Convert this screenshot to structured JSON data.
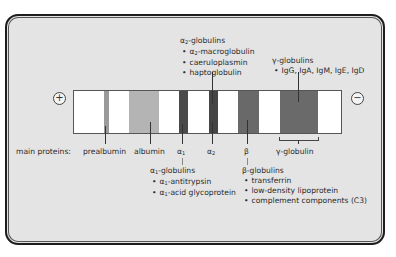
{
  "diagram": {
    "anode_symbol": "+",
    "cathode_symbol": "−",
    "row_label": "main proteins:",
    "bands": [
      {
        "id": "prealbumin",
        "label": "prealbumin",
        "color": "#9a9a9a"
      },
      {
        "id": "albumin",
        "label": "albumin",
        "color": "#b4b4b4"
      },
      {
        "id": "alpha1",
        "label": "α1",
        "color": "#4a4a4a"
      },
      {
        "id": "alpha2",
        "label": "α2",
        "color": "#454545"
      },
      {
        "id": "beta",
        "label": "β",
        "color": "#696969"
      },
      {
        "id": "gamma",
        "label": "γ-globulin",
        "color": "#6a6a6a"
      }
    ],
    "groups": {
      "alpha2": {
        "title": "α2-globulins",
        "items": [
          "α2-macroglobulin",
          "caeruloplasmin",
          "haptoglobulin"
        ]
      },
      "gamma": {
        "title": "γ-globulins",
        "items": [
          "IgG, IgA, IgM, IgE, IgD"
        ]
      },
      "alpha1": {
        "title": "α1-globulins",
        "items": [
          "α1-antitrypsin",
          "α1-acid glycoprotein"
        ]
      },
      "beta": {
        "title": "β-globulins",
        "items": [
          "transferrin",
          "low-density lipoprotein",
          "complement components (C3)"
        ]
      }
    }
  }
}
